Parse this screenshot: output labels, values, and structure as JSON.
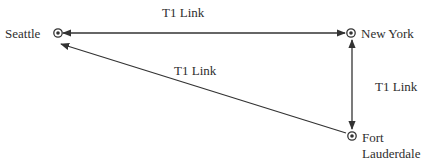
{
  "diagram": {
    "type": "network-topology",
    "line_color": "#333333",
    "nodes": [
      {
        "id": "seattle",
        "label": "Seattle",
        "icon": "target-node-icon",
        "x": 58,
        "y": 33
      },
      {
        "id": "new_york",
        "label": "New York",
        "icon": "target-node-icon",
        "x": 351,
        "y": 33
      },
      {
        "id": "fort_lauderdale",
        "label": "Fort\nLauderdale",
        "icon": "target-node-icon",
        "x": 352,
        "y": 136
      }
    ],
    "links": [
      {
        "id": "seattle-new_york",
        "from": "seattle",
        "to": "new_york",
        "label": "T1 Link",
        "arrows": "both"
      },
      {
        "id": "new_york-fort_lauderdale",
        "from": "new_york",
        "to": "fort_lauderdale",
        "label": "T1 Link",
        "arrows": "both"
      },
      {
        "id": "fort_lauderdale-seattle",
        "from": "fort_lauderdale",
        "to": "seattle",
        "label": "T1 Link",
        "arrows": "end"
      }
    ]
  }
}
